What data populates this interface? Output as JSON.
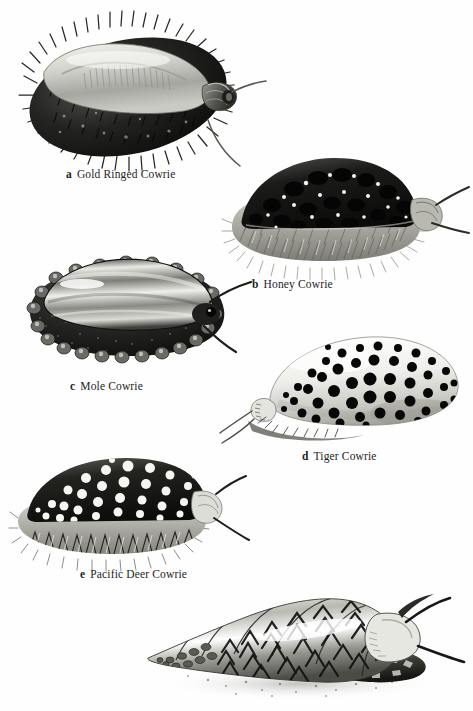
{
  "plate": {
    "kind": "scientific-illustration-plate",
    "medium": "grayscale airbrush / stipple drawing",
    "background_color": "#fefefe",
    "ink_color": "#1d1d1d",
    "figure_count": 6,
    "labeled_count": 5
  },
  "figures": [
    {
      "id": "a",
      "letter": "a",
      "name": "Gold Ringed Cowrie",
      "caption_x": 66,
      "caption_y": 168,
      "body": {
        "cx": 128,
        "cy": 97,
        "rx": 100,
        "ry": 57,
        "rot": -12,
        "mantle_tone": "#1a1a1a",
        "shell_tone": "#cfcfcb",
        "papillae": "long-fine-spines",
        "spine_count": 104,
        "spine_len": 13,
        "shell_slit": true,
        "siphon": {
          "x": 211,
          "y": 103,
          "len": 22,
          "rings": 5
        },
        "tentacles": [
          {
            "x1": 226,
            "y1": 96,
            "x2": 262,
            "y2": 84
          },
          {
            "x1": 208,
            "y1": 121,
            "x2": 252,
            "y2": 161
          }
        ]
      }
    },
    {
      "id": "b",
      "letter": "b",
      "name": "Honey Cowrie",
      "caption_x": 252,
      "caption_y": 278,
      "body": {
        "cx": 325,
        "cy": 213,
        "rx": 83,
        "ry": 43,
        "rot": -5,
        "mantle_tone": "#141414",
        "fringe_tone": "#a9a9a4",
        "papillae": "dense-short-bristles",
        "spine_count": 150,
        "spine_len": 9,
        "spot_count": 34,
        "spot_tone": "#0c0c0c",
        "fleck_tone": "#f2f2ef",
        "siphon": {
          "x": 400,
          "y": 205,
          "len": 15,
          "rings": 3
        },
        "tentacles": [
          {
            "x1": 411,
            "y1": 199,
            "x2": 440,
            "y2": 185
          },
          {
            "x1": 406,
            "y1": 218,
            "x2": 445,
            "y2": 231
          }
        ]
      }
    },
    {
      "id": "c",
      "letter": "c",
      "name": "Mole Cowrie",
      "caption_x": 70,
      "caption_y": 380,
      "body": {
        "cx": 122,
        "cy": 312,
        "rx": 86,
        "ry": 44,
        "rot": -8,
        "mantle_tone": "#2b2b2b",
        "shell_tone": "#e3e3e0",
        "papillae": "rounded-warts",
        "wart_count": 26,
        "band_count": 3,
        "siphon": {
          "x": 196,
          "y": 312,
          "len": 14,
          "rings": 2
        },
        "tentacles": [
          {
            "x1": 203,
            "y1": 302,
            "x2": 238,
            "y2": 292
          },
          {
            "x1": 198,
            "y1": 325,
            "x2": 230,
            "y2": 348
          }
        ]
      }
    },
    {
      "id": "d",
      "letter": "d",
      "name": "Tiger Cowrie",
      "caption_x": 302,
      "caption_y": 450,
      "body": {
        "cx": 358,
        "cy": 385,
        "rx": 90,
        "ry": 45,
        "rot": -7,
        "shell_tone": "#f1f1ee",
        "spot_tone": "#0a0a0a",
        "spot_count": 62,
        "spot_r_min": 3,
        "spot_r_max": 7,
        "aperture": {
          "x": 272,
          "y": 401,
          "w": 22,
          "h": 16
        },
        "tentacles": [
          {
            "x1": 268,
            "y1": 404,
            "x2": 232,
            "y2": 424
          },
          {
            "x1": 272,
            "y1": 412,
            "x2": 238,
            "y2": 438
          }
        ]
      }
    },
    {
      "id": "e",
      "letter": "e",
      "name": "Pacific Deer Cowrie",
      "caption_x": 80,
      "caption_y": 568,
      "body": {
        "cx": 112,
        "cy": 505,
        "rx": 88,
        "ry": 42,
        "rot": -6,
        "mantle_tone": "#1c1c1c",
        "fringe_tone": "#b6b6b1",
        "papillae": "branched-papillae",
        "spine_count": 68,
        "spine_len": 14,
        "spot_count": 48,
        "spot_tone": "#f4f4f1",
        "siphon": {
          "x": 192,
          "y": 497,
          "len": 16,
          "rings": 3
        },
        "tentacles": [
          {
            "x1": 203,
            "y1": 493,
            "x2": 230,
            "y2": 481
          },
          {
            "x1": 200,
            "y1": 514,
            "x2": 236,
            "y2": 540
          }
        ]
      }
    },
    {
      "id": "f",
      "letter": "",
      "name": "",
      "caption_x": null,
      "caption_y": null,
      "body": {
        "type": "triton-spiral-shell",
        "apex_x": 158,
        "apex_y": 648,
        "aperture_x": 392,
        "aperture_y": 634,
        "whorl_count": 9,
        "shell_tone": "#cfcfca",
        "chevron_tone": "#111111",
        "foot_tone": "#3a3a3a",
        "ground_shadow": true,
        "tentacles": [
          {
            "x1": 405,
            "y1": 622,
            "x2": 448,
            "y2": 604
          },
          {
            "x1": 416,
            "y1": 648,
            "x2": 462,
            "y2": 656
          }
        ]
      }
    }
  ]
}
